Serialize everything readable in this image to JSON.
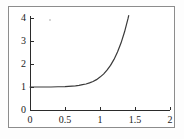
{
  "chart_data": {
    "type": "line",
    "title": "",
    "subtitle": "",
    "xlabel": "",
    "ylabel": "",
    "xlim": [
      0,
      2
    ],
    "ylim": [
      0,
      4
    ],
    "grid": false,
    "legend": null,
    "x_ticks": [
      {
        "value": 0,
        "label": "0"
      },
      {
        "value": 0.5,
        "label": "0.5"
      },
      {
        "value": 1,
        "label": "1"
      },
      {
        "value": 1.5,
        "label": "1.5"
      },
      {
        "value": 2,
        "label": "2"
      }
    ],
    "y_ticks": [
      {
        "value": 0,
        "label": "0"
      },
      {
        "value": 1,
        "label": "1"
      },
      {
        "value": 2,
        "label": "2"
      },
      {
        "value": 3,
        "label": "3"
      },
      {
        "value": 4,
        "label": "4"
      }
    ],
    "series": [
      {
        "name": "curve",
        "color": "#3a3a3a",
        "x": [
          0.0,
          0.1,
          0.2,
          0.3,
          0.4,
          0.5,
          0.6,
          0.65,
          0.7,
          0.75,
          0.8,
          0.85,
          0.9,
          0.95,
          1.0,
          1.05,
          1.1,
          1.15,
          1.2,
          1.25,
          1.3,
          1.35,
          1.4,
          1.41
        ],
        "y": [
          1.0,
          1.0,
          1.0,
          1.0,
          1.01,
          1.02,
          1.04,
          1.05,
          1.07,
          1.1,
          1.13,
          1.18,
          1.24,
          1.32,
          1.43,
          1.56,
          1.73,
          1.94,
          2.2,
          2.52,
          2.91,
          3.39,
          3.97,
          4.1
        ]
      }
    ],
    "axis_color": "#2b2b2b",
    "frame_color": "#8c8c8c",
    "background": "#ffffff"
  }
}
